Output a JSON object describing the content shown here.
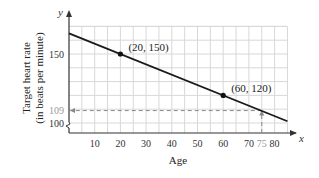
{
  "chart_data": {
    "type": "line",
    "title": "",
    "xlabel": "Age",
    "ylabel": "Target heart rate (in beats per minute)",
    "ylabel_lines": [
      "Target heart rate",
      "(in beats per minute)"
    ],
    "x_axis_symbol": "x",
    "y_axis_symbol": "y",
    "xlim": [
      0,
      85
    ],
    "ylim": [
      100,
      170
    ],
    "y_axis_broken": true,
    "grid": true,
    "x_ticks": [
      10,
      20,
      30,
      40,
      50,
      60,
      70,
      75,
      80
    ],
    "x_tick_labels": [
      "10",
      "20",
      "30",
      "40",
      "50",
      "60",
      "70",
      "75",
      "80"
    ],
    "y_ticks": [
      100,
      109,
      150
    ],
    "y_tick_labels": [
      "100",
      "109",
      "150"
    ],
    "series": [
      {
        "name": "Target heart rate line",
        "x": [
          0,
          85
        ],
        "y": [
          165,
          101.25
        ],
        "equation": "y = -0.75x + 165"
      }
    ],
    "points": [
      {
        "x": 20,
        "y": 150,
        "label": "(20, 150)"
      },
      {
        "x": 60,
        "y": 120,
        "label": "(60, 120)"
      }
    ],
    "annotations": [
      {
        "type": "dashed-guide",
        "from": [
          75,
          100
        ],
        "to": [
          75,
          109
        ],
        "label": "75"
      },
      {
        "type": "dashed-guide",
        "from": [
          75,
          109
        ],
        "to": [
          0,
          109
        ],
        "label": "109"
      }
    ],
    "colors": {
      "line": "#1a1a1a",
      "grid": "#d8d8d8",
      "guide": "#888888",
      "point": "#111111"
    }
  }
}
